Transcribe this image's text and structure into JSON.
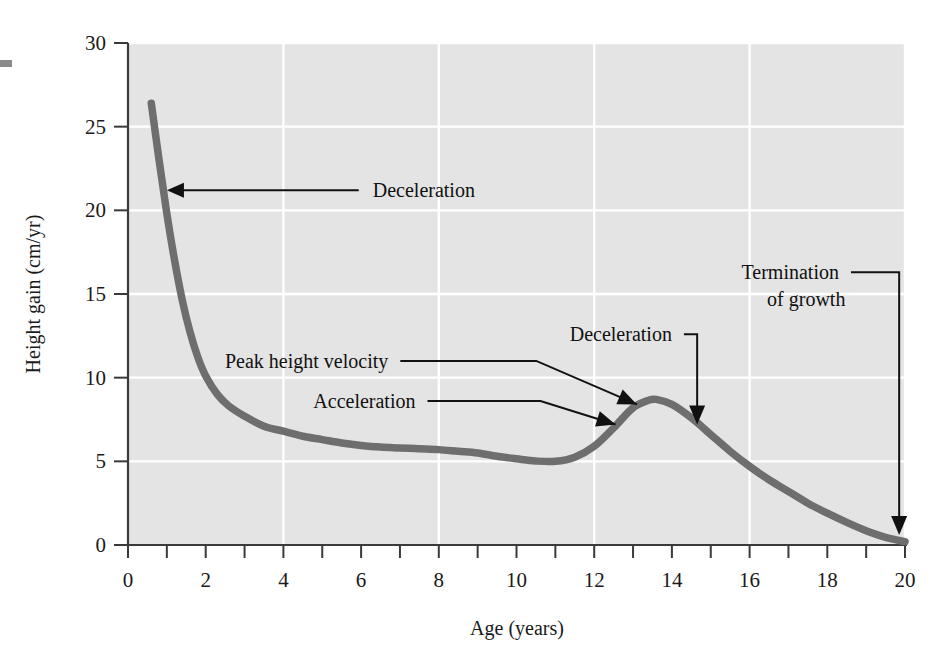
{
  "chart_data": {
    "type": "line",
    "title": "",
    "xlabel": "Age (years)",
    "ylabel": "Height gain (cm/yr)",
    "xlim": [
      0,
      20
    ],
    "ylim": [
      0,
      30
    ],
    "xticks": [
      0,
      1,
      2,
      3,
      4,
      5,
      6,
      7,
      8,
      9,
      10,
      11,
      12,
      13,
      14,
      15,
      16,
      17,
      18,
      19,
      20
    ],
    "xticklabels": [
      "0",
      "",
      "2",
      "",
      "4",
      "",
      "6",
      "",
      "8",
      "",
      "10",
      "",
      "12",
      "",
      "14",
      "",
      "16",
      "",
      "18",
      "",
      "20"
    ],
    "xticklabels_shown": [
      "0",
      "2",
      "4",
      "6",
      "8",
      "10",
      "12",
      "14",
      "16",
      "18",
      "20"
    ],
    "yticks": [
      0,
      5,
      10,
      15,
      20,
      25,
      30
    ],
    "yticklabels": [
      "0",
      "5",
      "10",
      "15",
      "20",
      "25",
      "30"
    ],
    "grid": "major-white-on-gray",
    "gridlines_x": [
      4,
      8,
      12,
      16,
      20
    ],
    "gridlines_y": [
      5,
      10,
      15,
      20,
      25,
      30
    ],
    "legend": "none",
    "plot_background": "#e4e4e4",
    "series": [
      {
        "name": "Height velocity",
        "color": "#6e6e6e",
        "x": [
          0.6,
          0.8,
          1.0,
          1.2,
          1.4,
          1.6,
          1.8,
          2.0,
          2.3,
          2.6,
          3.0,
          3.5,
          4.0,
          4.5,
          5.0,
          5.5,
          6.0,
          6.5,
          7.0,
          7.5,
          8.0,
          8.5,
          9.0,
          9.5,
          10.0,
          10.5,
          11.0,
          11.5,
          12.0,
          12.5,
          13.0,
          13.4,
          13.6,
          14.0,
          14.5,
          15.0,
          15.5,
          16.0,
          16.5,
          17.0,
          17.5,
          18.0,
          18.5,
          19.0,
          19.5,
          20.0
        ],
        "y": [
          26.4,
          23.0,
          19.8,
          17.0,
          14.6,
          12.7,
          11.2,
          10.1,
          9.0,
          8.3,
          7.7,
          7.1,
          6.8,
          6.5,
          6.3,
          6.1,
          5.95,
          5.85,
          5.8,
          5.75,
          5.7,
          5.6,
          5.5,
          5.3,
          5.15,
          5.02,
          5.0,
          5.25,
          5.9,
          7.0,
          8.2,
          8.65,
          8.7,
          8.4,
          7.6,
          6.6,
          5.6,
          4.7,
          3.9,
          3.2,
          2.5,
          1.9,
          1.35,
          0.85,
          0.45,
          0.2
        ]
      }
    ],
    "annotations": [
      {
        "id": "deceleration-early",
        "label": "Deceleration",
        "text_x": 6.3,
        "text_y": 21.2,
        "point_x": 0.95,
        "point_y": 21.2,
        "arrow": "left"
      },
      {
        "id": "peak-height-velocity",
        "label": "Peak height velocity",
        "text_x": 6.7,
        "text_y": 11.0,
        "point_x": 13.1,
        "point_y": 8.4,
        "arrow": "down-right"
      },
      {
        "id": "acceleration",
        "label": "Acceleration",
        "text_x": 7.4,
        "text_y": 8.6,
        "point_x": 12.55,
        "point_y": 7.2,
        "arrow": "down-right"
      },
      {
        "id": "deceleration-late",
        "label": "Deceleration",
        "text_x": 14.0,
        "text_y": 12.6,
        "point_x": 14.65,
        "point_y": 7.2,
        "arrow": "down"
      },
      {
        "id": "termination-of-growth",
        "label": "Termination of growth",
        "label_line1": "Termination",
        "label_line2": "of growth",
        "text_x": 18.3,
        "text_y": 16.3,
        "point_x": 19.85,
        "point_y": 0.6,
        "arrow": "down"
      }
    ]
  },
  "axes": {
    "x_title": "Age (years)",
    "y_title": "Height gain (cm/yr)"
  }
}
